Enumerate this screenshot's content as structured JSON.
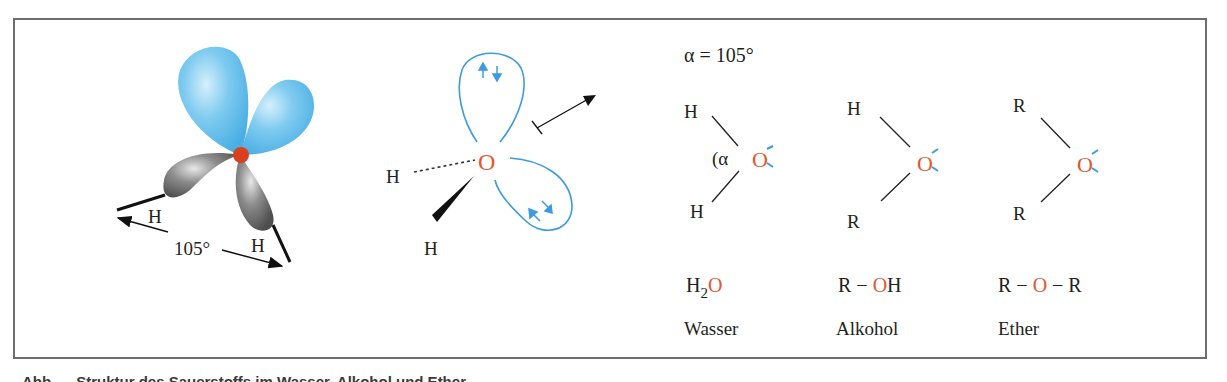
{
  "figure": {
    "panel_3d_model": {
      "labels": {
        "h_left": "H",
        "h_right": "H",
        "angle": "105°"
      },
      "colors": {
        "lone_pair_lobe": "#6ec3ee",
        "bond_lobe": "#7a7a7a",
        "oxygen_nucleus": "#d8401e"
      }
    },
    "panel_orbital_sketch": {
      "labels": {
        "oxygen": "O",
        "h_dashed": "H",
        "h_wedge": "H"
      },
      "colors": {
        "orbital_outline": "#3c9be0",
        "electron_arrows": "#3c9be0",
        "oxygen": "#e4572e"
      },
      "electron_pairs": [
        "↑↓",
        "↑↓"
      ]
    },
    "panel_structures": {
      "angle_label": "α = 105°",
      "structures": [
        {
          "top": "H",
          "bottom": "H",
          "center": "O",
          "angle_mark": "(α",
          "formula_parts": [
            "H",
            "2",
            "O"
          ],
          "name": "Wasser"
        },
        {
          "top": "H",
          "bottom": "R",
          "center": "O",
          "formula_parts": [
            "R − ",
            "O",
            "H"
          ],
          "name": "Alkohol"
        },
        {
          "top": "R",
          "bottom": "R",
          "center": "O",
          "formula_parts": [
            "R − ",
            "O",
            " − R"
          ],
          "name": "Ether"
        }
      ],
      "colors": {
        "oxygen": "#e4572e",
        "lone_pair_bars": "#3c9be0"
      }
    },
    "caption_truncated": "Abb. ... Struktur des Sauerstoffs im Wasser, Alkohol und Ether ..."
  }
}
